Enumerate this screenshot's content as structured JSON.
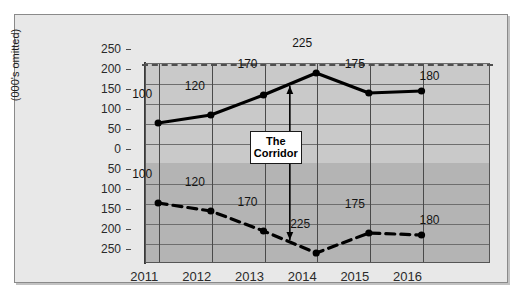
{
  "chart_data": {
    "type": "line",
    "title": "",
    "subtitle": "",
    "xlabel": "",
    "ylabel": "(000's omitted)",
    "categories": [
      "2011",
      "2012",
      "2013",
      "2014",
      "2015",
      "2016"
    ],
    "series": [
      {
        "name": "Upper corridor boundary",
        "style": "solid",
        "values": [
          100,
          120,
          170,
          225,
          175,
          180
        ],
        "labels": [
          "100",
          "120",
          "170",
          "225",
          "175",
          "180"
        ]
      },
      {
        "name": "Lower corridor boundary",
        "style": "dashed",
        "values": [
          -100,
          -120,
          -170,
          -225,
          -175,
          -180
        ],
        "labels": [
          "100",
          "120",
          "170",
          "225",
          "175",
          "180"
        ]
      }
    ],
    "y_ticks": [
      250,
      200,
      150,
      100,
      50,
      0,
      50,
      100,
      150,
      200,
      250
    ],
    "y_tick_values": [
      250,
      200,
      150,
      100,
      50,
      0,
      -50,
      -100,
      -150,
      -200,
      -250
    ],
    "ylim": [
      -250,
      250
    ],
    "grid": true,
    "legend": "none",
    "zero_line_style": "dashed",
    "annotations": [
      {
        "name": "corridor-callout",
        "text_line1": "The",
        "text_line2": "Corridor",
        "at_category": "2013-2014",
        "arrow": "double-headed vertical"
      }
    ]
  },
  "axis": {
    "y_title": "(000's omitted)",
    "y_labels": [
      "250",
      "200",
      "150",
      "100",
      "50",
      "0",
      "50",
      "100",
      "150",
      "200",
      "250"
    ],
    "x_labels": [
      "2011",
      "2012",
      "2013",
      "2014",
      "2015",
      "2016"
    ]
  },
  "labels": {
    "upper": [
      "100",
      "120",
      "170",
      "225",
      "175",
      "180"
    ],
    "lower": [
      "100",
      "120",
      "170",
      "225",
      "175",
      "180"
    ]
  },
  "callout": {
    "line1": "The",
    "line2": "Corridor"
  },
  "colors": {
    "plot_background_upper": "#c9c9c9",
    "plot_background_lower": "#b4b4b4",
    "card_background": "#e8e8e8",
    "series_line": "#000000",
    "grid": "#6e6e6e",
    "zero_line": "#4f4f4f",
    "callout_background": "#ffffff"
  }
}
